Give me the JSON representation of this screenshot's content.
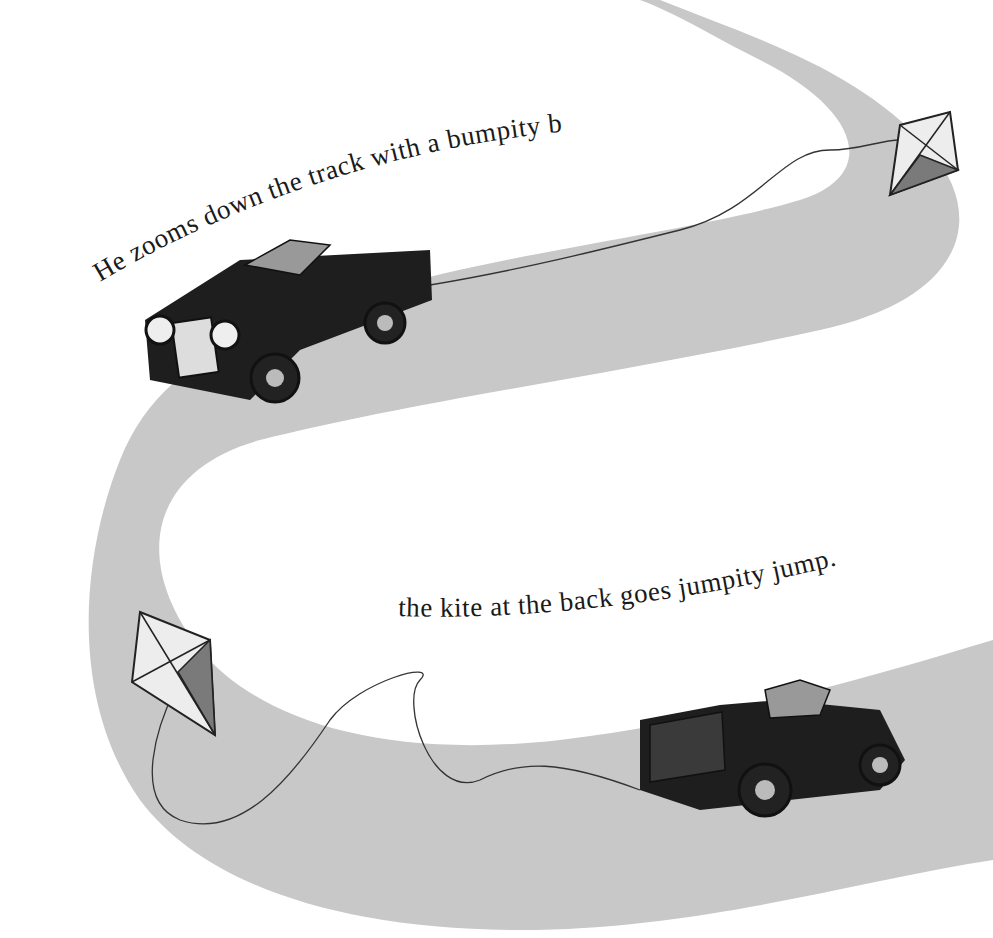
{
  "page": {
    "type": "picture-book-spread",
    "width": 993,
    "height": 938
  },
  "text": {
    "line1": "He zooms down the track with a bumpity bump,",
    "line2": "the kite at the back goes jumpity jump."
  },
  "illustration": {
    "road": {
      "description": "winding grey S-shaped track",
      "color": "#c8c8c8"
    },
    "cars": [
      {
        "id": "car-top",
        "description": "vintage black open-top car driving toward viewer, trailing kite string",
        "color": "#1e1e1e"
      },
      {
        "id": "car-bottom",
        "description": "vintage black pickup-style car driving right, trailing kite string",
        "color": "#1e1e1e"
      }
    ],
    "kites": [
      {
        "id": "kite-top-right",
        "description": "diamond kite with light and dark panels"
      },
      {
        "id": "kite-bottom-left",
        "description": "diamond kite with light and dark panels"
      }
    ]
  },
  "colors": {
    "background": "#ffffff",
    "road": "#c8c8c8",
    "road_edge": "#bdbdbd",
    "ink": "#1a1a1a",
    "car_body": "#1e1e1e",
    "kite_light": "#ededed",
    "kite_dark": "#7a7a7a"
  }
}
